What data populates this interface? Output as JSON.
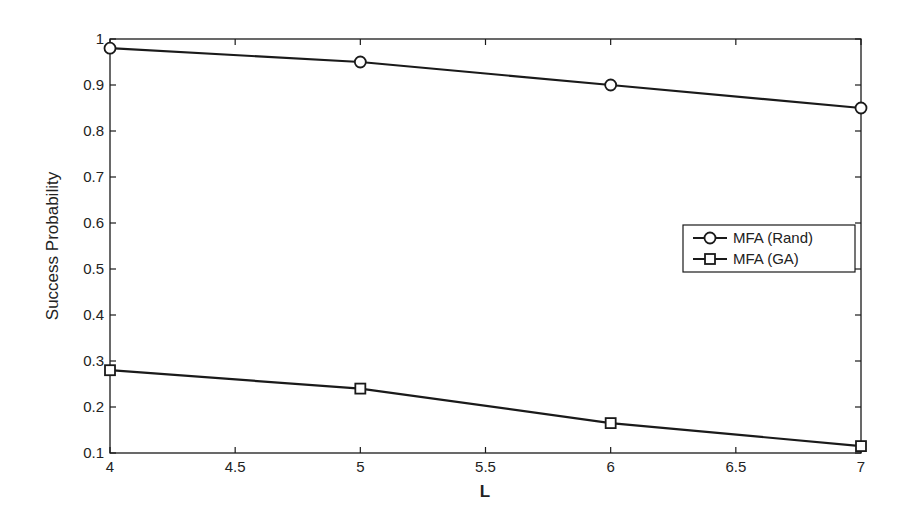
{
  "chart_data": {
    "type": "line",
    "title": "",
    "xlabel": "L",
    "ylabel": "Success Probability",
    "xlim": [
      4,
      7
    ],
    "ylim": [
      0.1,
      1
    ],
    "xticks": [
      "4",
      "4.5",
      "5",
      "5.5",
      "6",
      "6.5",
      "7"
    ],
    "yticks": [
      "0.1",
      "0.2",
      "0.3",
      "0.4",
      "0.5",
      "0.6",
      "0.7",
      "0.8",
      "0.9",
      "1"
    ],
    "grid": false,
    "legend_position": "right-middle",
    "x": [
      4,
      5,
      6,
      7
    ],
    "series": [
      {
        "name": "MFA (Rand)",
        "marker": "circle",
        "values": [
          0.98,
          0.95,
          0.9,
          0.85
        ]
      },
      {
        "name": "MFA (GA)",
        "marker": "square",
        "values": [
          0.28,
          0.24,
          0.165,
          0.115
        ]
      }
    ]
  },
  "colors": {
    "line": "#1a1a1a",
    "background": "#ffffff",
    "marker_fill": "#ffffff"
  }
}
